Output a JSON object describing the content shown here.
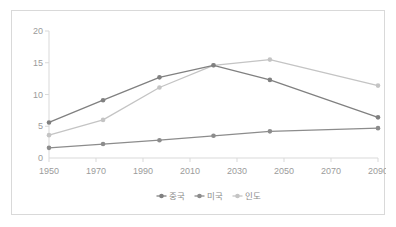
{
  "chart_data": {
    "type": "line",
    "title": "",
    "subtitle": "",
    "xlabel": "",
    "ylabel": "",
    "xlim": [
      1950,
      2090
    ],
    "ylim": [
      0,
      20
    ],
    "yticks": [
      0,
      5,
      10,
      15,
      20
    ],
    "xticks": [
      1950,
      1970,
      1990,
      2010,
      2030,
      2050,
      2070,
      2090
    ],
    "grid": false,
    "legend_position": "bottom",
    "x": [
      1950,
      1973,
      1997,
      2020,
      2044,
      2090
    ],
    "series": [
      {
        "name": "중국",
        "color": "#808080",
        "values": [
          5.6,
          9.1,
          12.7,
          14.6,
          12.3,
          6.4
        ]
      },
      {
        "name": "미국",
        "color": "#8c8c8c",
        "values": [
          1.6,
          2.2,
          2.8,
          3.5,
          4.2,
          4.7
        ]
      },
      {
        "name": "인도",
        "color": "#c4c4c4",
        "values": [
          3.6,
          6.0,
          11.1,
          14.6,
          15.5,
          11.4
        ]
      }
    ]
  },
  "axis": {
    "y_tick_labels": [
      "0",
      "5",
      "10",
      "15",
      "20"
    ],
    "x_tick_labels": [
      "1950",
      "1970",
      "1990",
      "2010",
      "2030",
      "2050",
      "2070",
      "2090"
    ]
  },
  "legend": {
    "items": [
      {
        "label": "중국",
        "color": "#808080"
      },
      {
        "label": "미국",
        "color": "#8c8c8c"
      },
      {
        "label": "인도",
        "color": "#c4c4c4"
      }
    ]
  },
  "colors": {
    "border": "#d9d9d9",
    "axis": "#d9d9d9",
    "tick_text": "#9b9b9b",
    "legend_text": "#8c8c8c",
    "background": "#ffffff"
  }
}
